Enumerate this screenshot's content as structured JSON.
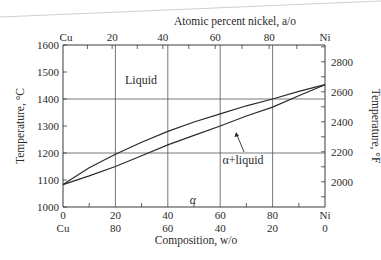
{
  "chart_data": {
    "type": "line",
    "title": "",
    "top_axis_label": "Atomic percent nickel, a/o",
    "xlabel": "Composition, w/o",
    "ylabel": "Temperature, °C",
    "ylabel_right": "Temperature, °F",
    "xlim": [
      0,
      100
    ],
    "ylim": [
      1000,
      1600
    ],
    "grid": true,
    "x_ticks_bottom_ni": [
      "0",
      "20",
      "40",
      "60",
      "80",
      "Ni"
    ],
    "x_ticks_bottom_cu": [
      "Cu",
      "80",
      "60",
      "40",
      "20",
      "0"
    ],
    "x_ticks_top": [
      "Cu",
      "20",
      "40",
      "60",
      "80",
      "Ni"
    ],
    "y_ticks_left": [
      "1000",
      "1100",
      "1200",
      "1300",
      "1400",
      "1500",
      "1600"
    ],
    "y_ticks_right": [
      "2000",
      "2200",
      "2400",
      "2600",
      "2800"
    ],
    "regions": [
      "Liquid",
      "α+liquid",
      "α"
    ],
    "series": [
      {
        "name": "Liquidus",
        "x": [
          0,
          10,
          20,
          30,
          40,
          50,
          60,
          70,
          80,
          90,
          100
        ],
        "values": [
          1083,
          1145,
          1195,
          1240,
          1280,
          1315,
          1345,
          1375,
          1400,
          1428,
          1453
        ]
      },
      {
        "name": "Solidus",
        "x": [
          0,
          10,
          20,
          30,
          40,
          50,
          60,
          70,
          80,
          90,
          100
        ],
        "values": [
          1083,
          1115,
          1150,
          1190,
          1230,
          1265,
          1300,
          1337,
          1370,
          1412,
          1453
        ]
      }
    ]
  },
  "labels": {
    "top_axis": "Atomic percent nickel, a/o",
    "bottom_axis": "Composition, w/o",
    "left_axis": "Temperature, °C",
    "right_axis": "Temperature, °F",
    "liquid": "Liquid",
    "two_phase": "α+liquid",
    "alpha": "α"
  }
}
